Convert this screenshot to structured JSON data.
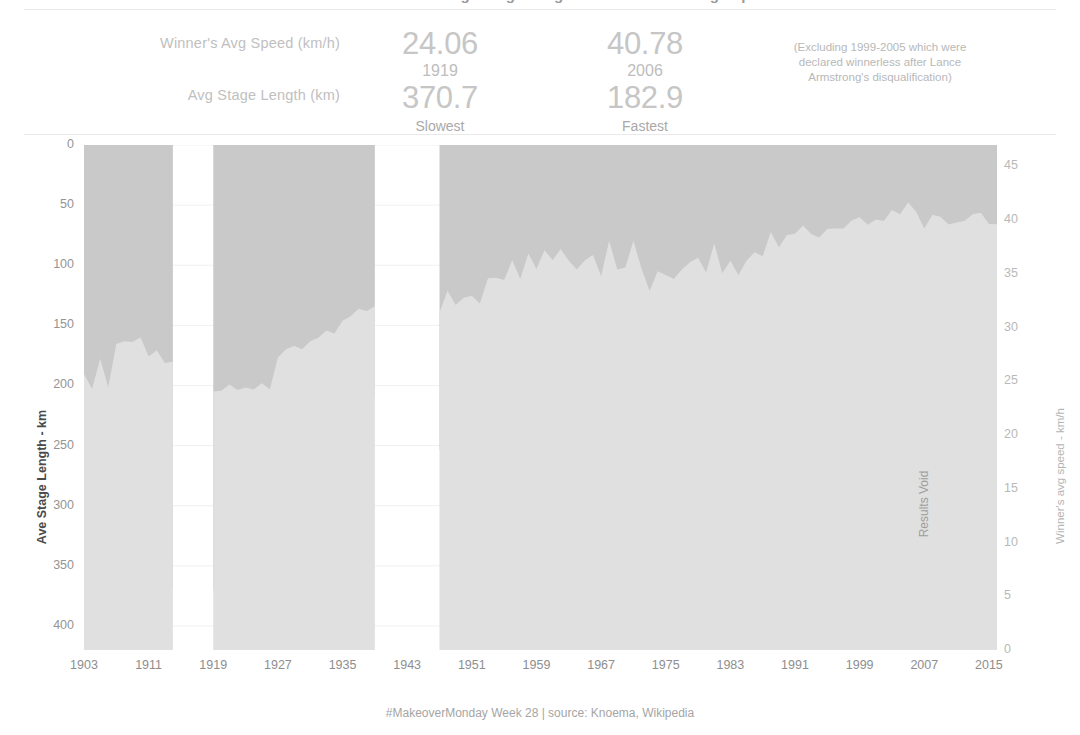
{
  "header": {
    "title": "Tour de France: Average Stage Length vs Winner's Average Speed",
    "kpi_label_speed": "Winner's Avg Speed (km/h)",
    "kpi_label_stage": "Avg Stage Length (km)",
    "slowest": {
      "speed": "24.06",
      "year": "1919",
      "stage_length": "370.7",
      "caption": "Slowest"
    },
    "fastest": {
      "speed": "40.78",
      "year": "2006",
      "stage_length": "182.9",
      "caption": "Fastest"
    },
    "note": "(Excluding 1999-2005 which were declared winnerless after Lance Armstrong's disqualification)"
  },
  "chart_annotation": {
    "results_void": "Results Void"
  },
  "footer": {
    "text": "#MakeoverMonday Week 28 | source: Knoema, Wikipedia"
  },
  "colors": {
    "stage_area": "#c9c9c9",
    "speed_area": "#e0e0e0",
    "void_band": "#d6d6d6",
    "grid": "#f0f0f0",
    "tick_text": "#949494",
    "kpi_big": "#c6c6c6"
  },
  "chart_data": {
    "type": "area",
    "title": "Tour de France: Average Stage Length vs Winner's Average Speed",
    "xlabel": "",
    "ylabel": "Ave Stage Length - km",
    "ylabel_right": "Winner's avg speed - km/h",
    "grid": true,
    "legend": "none",
    "xlim": [
      1903,
      2016
    ],
    "ylim_left": [
      0,
      420
    ],
    "ylim_left_inverted": true,
    "ylim_right": [
      0,
      47
    ],
    "yticks_left": [
      0,
      50,
      100,
      150,
      200,
      250,
      300,
      350,
      400
    ],
    "yticks_right": [
      0,
      5,
      10,
      15,
      20,
      25,
      30,
      35,
      40,
      45
    ],
    "xticks": [
      1903,
      1911,
      1919,
      1927,
      1935,
      1943,
      1951,
      1959,
      1967,
      1975,
      1983,
      1991,
      1999,
      2007,
      2015
    ],
    "gaps": [
      [
        1915,
        1918
      ],
      [
        1940,
        1946
      ]
    ],
    "shaded_band": {
      "from": 1999,
      "to": 2005,
      "label": "Results Void"
    },
    "series": [
      {
        "name": "Ave Stage Length - km",
        "axis": "left",
        "x": [
          1903,
          1904,
          1905,
          1906,
          1907,
          1908,
          1909,
          1910,
          1911,
          1912,
          1913,
          1914,
          1919,
          1920,
          1921,
          1922,
          1923,
          1924,
          1925,
          1926,
          1927,
          1928,
          1929,
          1930,
          1931,
          1932,
          1933,
          1934,
          1935,
          1936,
          1937,
          1938,
          1939,
          1947,
          1948,
          1949,
          1950,
          1951,
          1952,
          1953,
          1954,
          1955,
          1956,
          1957,
          1958,
          1959,
          1960,
          1961,
          1962,
          1963,
          1964,
          1965,
          1966,
          1967,
          1968,
          1969,
          1970,
          1971,
          1972,
          1973,
          1974,
          1975,
          1976,
          1977,
          1978,
          1979,
          1980,
          1981,
          1982,
          1983,
          1984,
          1985,
          1986,
          1987,
          1988,
          1989,
          1990,
          1991,
          1992,
          1993,
          1994,
          1995,
          1996,
          1997,
          1998,
          1999,
          2000,
          2001,
          2002,
          2003,
          2004,
          2005,
          2006,
          2007,
          2008,
          2009,
          2010,
          2011,
          2012,
          2013,
          2014,
          2015,
          2016
        ],
        "values": [
          404.2,
          395.1,
          299.7,
          357.3,
          356.6,
          357.6,
          357.0,
          364.5,
          362.8,
          361.8,
          367.8,
          367.1,
          370.7,
          372.8,
          361.1,
          361.9,
          363.9,
          379.6,
          342.9,
          349.7,
          386.4,
          316.0,
          291.3,
          282.9,
          275.4,
          222.7,
          212.6,
          206.3,
          201.3,
          205.6,
          190.5,
          201.1,
          209.6,
          253.7,
          253.8,
          258.0,
          253.8,
          249.6,
          250.6,
          243.2,
          260.1,
          249.0,
          247.5,
          246.4,
          250.1,
          224.8,
          213.0,
          203.2,
          202.9,
          210.1,
          211.8,
          195.1,
          201.4,
          188.0,
          198.7,
          186.2,
          188.6,
          185.3,
          189.5,
          200.9,
          194.4,
          183.4,
          182.0,
          184.6,
          173.7,
          170.9,
          173.7,
          177.2,
          155.4,
          172.4,
          180.2,
          176.9,
          181.5,
          177.9,
          174.6,
          171.8,
          176.9,
          178.1,
          176.9,
          173.2,
          176.2,
          176.1,
          175.4,
          176.2,
          177.2,
          176.1,
          176.2,
          148.2,
          168.8,
          159.3,
          162.4,
          163.3,
          182.9,
          178.6,
          167.7,
          168.8,
          169.8,
          170.4,
          166.6,
          150.4,
          166.0,
          166.4,
          168.0
        ]
      },
      {
        "name": "Winner's avg speed - km/h",
        "axis": "right",
        "x": [
          1903,
          1904,
          1905,
          1906,
          1907,
          1908,
          1909,
          1910,
          1911,
          1912,
          1913,
          1914,
          1919,
          1920,
          1921,
          1922,
          1923,
          1924,
          1925,
          1926,
          1927,
          1928,
          1929,
          1930,
          1931,
          1932,
          1933,
          1934,
          1935,
          1936,
          1937,
          1938,
          1939,
          1947,
          1948,
          1949,
          1950,
          1951,
          1952,
          1953,
          1954,
          1955,
          1956,
          1957,
          1958,
          1959,
          1960,
          1961,
          1962,
          1963,
          1964,
          1965,
          1966,
          1967,
          1968,
          1969,
          1970,
          1971,
          1972,
          1973,
          1974,
          1975,
          1976,
          1977,
          1978,
          1979,
          1980,
          1981,
          1982,
          1983,
          1984,
          1985,
          1986,
          1987,
          1988,
          1989,
          1990,
          1991,
          1992,
          1993,
          1994,
          1995,
          1996,
          1997,
          1998,
          1999,
          2000,
          2001,
          2002,
          2003,
          2004,
          2005,
          2006,
          2007,
          2008,
          2009,
          2010,
          2011,
          2012,
          2013,
          2014,
          2015,
          2016
        ],
        "values": [
          25.68,
          24.3,
          27.11,
          24.46,
          28.47,
          28.74,
          28.66,
          29.1,
          27.32,
          27.89,
          26.72,
          26.83,
          24.06,
          24.13,
          24.72,
          24.19,
          24.43,
          24.25,
          24.82,
          24.27,
          27.22,
          28.0,
          28.32,
          27.98,
          28.73,
          29.05,
          29.73,
          29.46,
          30.65,
          31.07,
          31.77,
          31.56,
          31.99,
          31.41,
          33.44,
          32.12,
          32.78,
          32.98,
          32.24,
          34.59,
          34.64,
          34.44,
          36.27,
          34.52,
          36.91,
          35.47,
          37.21,
          36.27,
          37.32,
          36.23,
          35.42,
          36.27,
          36.77,
          34.78,
          38.09,
          35.41,
          35.59,
          38.08,
          35.51,
          33.41,
          35.24,
          34.91,
          34.52,
          35.42,
          36.08,
          36.51,
          35.14,
          37.84,
          35.06,
          36.23,
          34.91,
          36.23,
          37.02,
          36.65,
          38.91,
          37.49,
          38.62,
          38.75,
          39.5,
          38.71,
          38.38,
          39.19,
          39.23,
          39.24,
          39.98,
          40.28,
          39.57,
          40.07,
          39.93,
          40.94,
          40.55,
          41.65,
          40.78,
          39.23,
          40.5,
          40.32,
          39.59,
          39.79,
          39.94,
          40.55,
          40.69,
          39.64,
          39.62
        ]
      }
    ]
  }
}
